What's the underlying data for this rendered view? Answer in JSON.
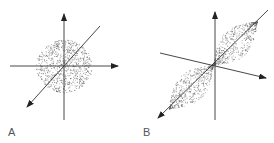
{
  "panels": [
    {
      "label": "A",
      "description": "spherical isotropic point cloud centered on 3D axes"
    },
    {
      "label": "B",
      "description": "elongated double-lobe point cloud along diagonal axis"
    }
  ],
  "colors": {
    "axis": "#333333",
    "dots": "#555555"
  }
}
